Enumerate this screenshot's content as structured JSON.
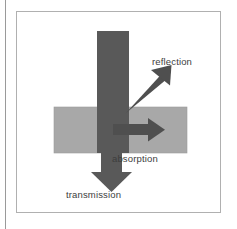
{
  "figure": {
    "background_color": "#ffffff",
    "frame_border_color": "#b0b0b0",
    "margin_rule_color": "#9a9a9a"
  },
  "colors": {
    "beam_dark": "#595959",
    "arrow_dark": "#4f4f4f",
    "slab_gray": "#a8a8a8",
    "slab_border": "#8f8f8f",
    "label_text": "#3d3d3d",
    "canvas_white": "#ffffff"
  },
  "labels": {
    "reflection": "reflection",
    "absorption": "absorption",
    "transmission": "transmission"
  },
  "elements": {
    "slab_name": "material-slab",
    "incident_beam_name": "incident-beam",
    "reflection_arrow_name": "reflection-arrow",
    "absorption_arrow_name": "absorption-arrow",
    "transmission_arrow_name": "transmission-arrow"
  },
  "geometry": {
    "slab": {
      "x": 37,
      "y": 95,
      "width": 133,
      "height": 46
    },
    "incident_beam": {
      "x": 80,
      "y": 19,
      "width": 32,
      "height": 88
    },
    "transmission_shaft": {
      "x": 84,
      "y": 107,
      "width": 21,
      "height": 60
    },
    "reflection_arrow": {
      "from_x": 112,
      "from_y": 96,
      "to_x": 150,
      "to_y": 58
    },
    "absorption_arrow": {
      "from_x": 105,
      "from_y": 117,
      "to_x": 138,
      "to_y": 117
    },
    "transmission_tip": {
      "x": 94,
      "y": 178
    }
  }
}
